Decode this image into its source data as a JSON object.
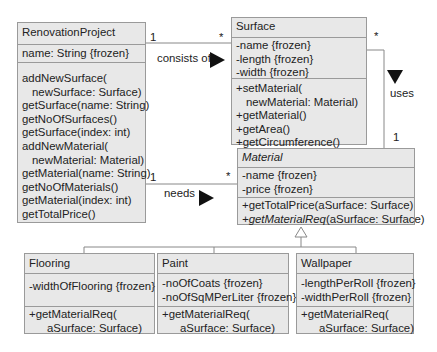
{
  "classes": {
    "renovation": {
      "name": "RenovationProject",
      "attributes": [
        "name: String {frozen}"
      ],
      "operations": [
        "addNewSurface(",
        "  newSurface: Surface)",
        "getSurface(name: String)",
        "getNoOfSurfaces()",
        "getSurface(index: int)",
        "addNewMaterial(",
        "  newMaterial: Material)",
        "getMaterial(name: String)",
        "getNoOfMaterials()",
        "getMaterial(index: int)",
        "getTotalPrice()"
      ]
    },
    "surface": {
      "name": "Surface",
      "attributes": [
        "-name {frozen}",
        "-length {frozen}",
        "-width {frozen}"
      ],
      "operations": [
        "+setMaterial(",
        "  newMaterial: Material)",
        "+getMaterial()",
        "+getArea()",
        "+getCircumference()"
      ]
    },
    "material": {
      "name": "Material",
      "attributes": [
        "-name {frozen}",
        "-price {frozen}"
      ],
      "operations": [
        "+getTotalPrice(aSurface: Surface)",
        "+getMaterialReq",
        "(aSurface: Surface)"
      ]
    },
    "flooring": {
      "name": "Flooring",
      "attributes": [
        "-widthOfFlooring {frozen}"
      ],
      "operations": [
        "+getMaterialReq(",
        "  aSurface: Surface)"
      ]
    },
    "paint": {
      "name": "Paint",
      "attributes": [
        "-noOfCoats {frozen}",
        "-noOfSqMPerLiter {frozen}"
      ],
      "operations": [
        "+getMaterialReq(",
        "  aSurface: Surface)"
      ]
    },
    "wallpaper": {
      "name": "Wallpaper",
      "attributes": [
        "-lengthPerRoll {frozen}",
        "-widthPerRoll {frozen}"
      ],
      "operations": [
        "+getMaterialReq(",
        "  aSurface: Surface)"
      ]
    }
  },
  "associations": {
    "consists_of": {
      "label": "consists of",
      "mult_left": "1",
      "mult_right": "*"
    },
    "needs": {
      "label": "needs",
      "mult_left": "1",
      "mult_right": "*"
    },
    "uses": {
      "label": "uses",
      "mult_top": "*",
      "mult_bottom": "1"
    }
  },
  "colors": {
    "box_fill": "#e8e8e8",
    "box_border": "#9a9a9a",
    "line": "#888888",
    "arrow": "#111111"
  }
}
